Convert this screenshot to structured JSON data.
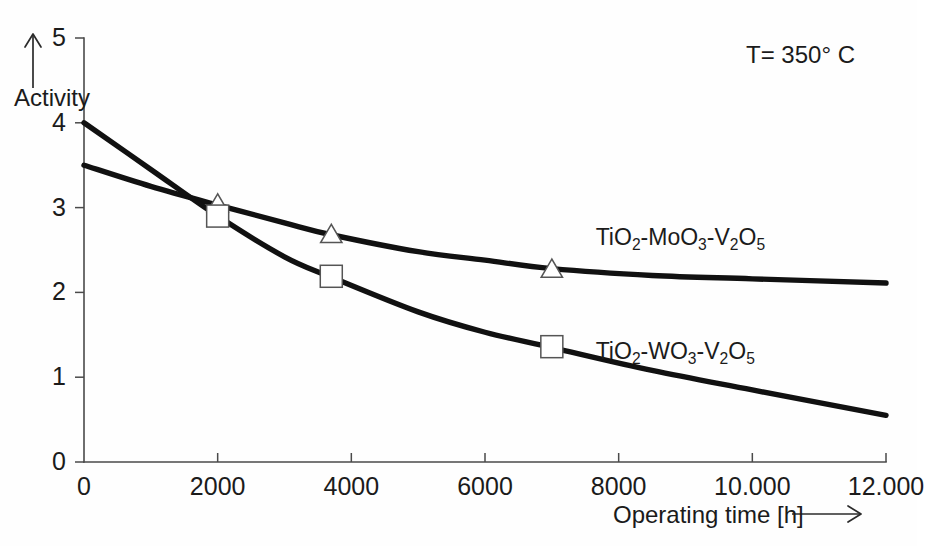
{
  "chart_data": {
    "type": "line",
    "title": "",
    "subtitle": "",
    "xlabel": "Operating time [h]",
    "ylabel": "Activity",
    "xlim": [
      0,
      12000
    ],
    "ylim": [
      0,
      5
    ],
    "grid": false,
    "legend_position": "inline-right",
    "x_ticks": [
      0,
      2000,
      4000,
      6000,
      8000,
      10000,
      12000
    ],
    "x_tick_labels": [
      "0",
      "2000",
      "4000",
      "6000",
      "8000",
      "10.000",
      "12.000"
    ],
    "y_ticks": [
      0,
      1,
      2,
      3,
      4,
      5
    ],
    "y_tick_labels": [
      "0",
      "1",
      "2",
      "3",
      "4",
      "5"
    ],
    "annotations": [
      {
        "name": "temperature",
        "text": "T= 350° C",
        "x": 10200,
        "y": 4.72
      }
    ],
    "series": [
      {
        "name": "TiO2-MoO3-V2O5",
        "label_html": "TiO<sub>2</sub>-MoO<sub>3</sub>-V<sub>2</sub>O<sub>5</sub>",
        "marker": "triangle",
        "marker_fill": "open",
        "color": "#111111",
        "x": [
          0,
          1000,
          2000,
          3000,
          3700,
          5000,
          6000,
          7000,
          8500,
          10000,
          12000
        ],
        "y": [
          3.5,
          3.25,
          3.03,
          2.82,
          2.68,
          2.48,
          2.38,
          2.28,
          2.2,
          2.16,
          2.11
        ],
        "marker_points": [
          {
            "x": 2000,
            "y": 3.04
          },
          {
            "x": 3700,
            "y": 2.68
          },
          {
            "x": 7000,
            "y": 2.27
          }
        ],
        "label_anchor": {
          "x": 10050,
          "y": 2.62
        }
      },
      {
        "name": "TiO2-WO3-V2O5",
        "label_html": "TiO<sub>2</sub>-WO<sub>3</sub>-V<sub>2</sub>O<sub>5</sub>",
        "marker": "square",
        "marker_fill": "open",
        "color": "#111111",
        "x": [
          0,
          1000,
          2000,
          3000,
          3700,
          5000,
          6000,
          7000,
          8500,
          10000,
          12000
        ],
        "y": [
          4.0,
          3.45,
          2.9,
          2.42,
          2.18,
          1.77,
          1.53,
          1.35,
          1.08,
          0.85,
          0.55
        ],
        "marker_points": [
          {
            "x": 2000,
            "y": 2.9
          },
          {
            "x": 3700,
            "y": 2.19
          },
          {
            "x": 7000,
            "y": 1.36
          }
        ],
        "label_anchor": {
          "x": 10050,
          "y": 1.27
        }
      }
    ],
    "axis_arrows": {
      "y_axis_arrow": "up",
      "x_axis_arrow": "right"
    }
  },
  "colors": {
    "background": "#fefefe",
    "curve": "#111111",
    "axis": "#4a4a4a",
    "text": "#1b1b1b",
    "marker_fill": "#ffffff",
    "marker_stroke": "#555555"
  }
}
